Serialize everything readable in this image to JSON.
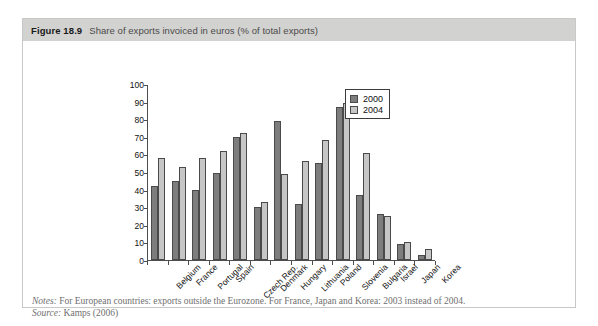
{
  "figure": {
    "number": "Figure 18.9",
    "caption": "Share of exports invoiced in euros (% of total exports)"
  },
  "footer": {
    "notes_key": "Notes:",
    "notes_text": "For European countries: exports outside the Eurozone. For France, Japan and Korea: 2003 instead of 2004.",
    "source_key": "Source:",
    "source_text": "Kamps (2006)"
  },
  "colors": {
    "series_2000": "#7d7d7d",
    "series_2004": "#c6c6c6",
    "bar_border": "#4a4a4a",
    "caption_bar": "#d2d2d0",
    "axis": "#4d4d4d"
  },
  "chart_data": {
    "type": "bar",
    "title": "Share of exports invoiced in euros (% of total exports)",
    "xlabel": "",
    "ylabel": "",
    "ylim": [
      0,
      100
    ],
    "yticks": [
      0,
      10,
      20,
      30,
      40,
      50,
      60,
      70,
      80,
      90,
      100
    ],
    "ytick_labels": [
      "0",
      "10",
      "20",
      "30",
      "40",
      "50",
      "60",
      "70",
      "80",
      "90",
      "100"
    ],
    "grid": false,
    "legend_position": "upper right",
    "categories": [
      "Belgium",
      "France",
      "Portugal",
      "Spain",
      "Czech Rep.",
      "Denmark",
      "Hungary",
      "Lithuania",
      "Poland",
      "Slovenia",
      "Bulgaria",
      "Israel",
      "Japan",
      "Korea"
    ],
    "series": [
      {
        "name": "2000",
        "color": "#7d7d7d",
        "values": [
          42,
          45,
          40,
          49.5,
          70,
          30,
          79,
          32,
          55,
          87,
          37,
          26,
          9,
          3
        ]
      },
      {
        "name": "2004",
        "color": "#c6c6c6",
        "values": [
          58,
          53,
          58,
          62,
          72,
          33,
          49,
          56,
          68,
          89,
          61,
          25,
          10,
          6
        ]
      }
    ]
  }
}
